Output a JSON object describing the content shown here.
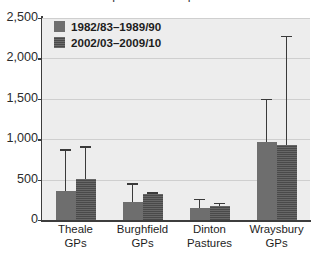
{
  "chart_data": {
    "type": "bar",
    "title": "reported in Annual Reports",
    "title_note": "clipped at top edge of screenshot",
    "xlabel": "",
    "ylabel": "",
    "ylim": [
      0,
      2500
    ],
    "yticks": [
      0,
      500,
      1000,
      1500,
      2000,
      2500
    ],
    "ytick_labels": [
      "0",
      "500",
      "1,000",
      "1,500",
      "2,000",
      "2,500"
    ],
    "grid": true,
    "legend_position": "top-left",
    "categories": [
      "Theale GPs",
      "Burghfield GPs",
      "Dinton Pastures",
      "Wraysbury GPs"
    ],
    "category_lines": [
      [
        "Theale",
        "GPs"
      ],
      [
        "Burghfield",
        "GPs"
      ],
      [
        "Dinton",
        "Pastures"
      ],
      [
        "Wraysbury",
        "GPs"
      ]
    ],
    "series": [
      {
        "name": "1982/83–1989/90",
        "color": "#6e6e6e",
        "values": [
          355,
          225,
          150,
          965
        ],
        "error_upper": [
          875,
          455,
          265,
          1500
        ]
      },
      {
        "name": "2002/03–2009/10",
        "color": "#4a4a4a",
        "values": [
          510,
          320,
          170,
          925
        ],
        "error_upper": [
          910,
          345,
          215,
          2280
        ]
      }
    ]
  },
  "colors": {
    "page_background": "#ffffff",
    "plot_background": "#ededed",
    "gridline": "#cfcfcf",
    "axis": "#3d3d3d",
    "error_bar": "#3a3a3a",
    "text": "#1d1d1d",
    "series_1": "#6e6e6e",
    "series_2": "#4a4a4a"
  }
}
